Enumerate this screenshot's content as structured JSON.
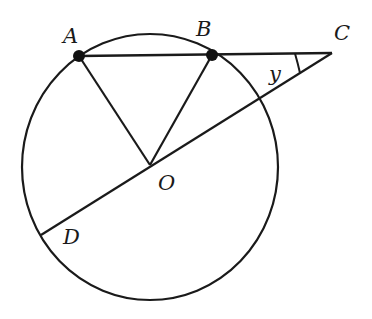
{
  "diagram": {
    "type": "geometry",
    "stroke_color": "#1a1a1a",
    "background": "#ffffff",
    "circle": {
      "center": "O",
      "cx": 150,
      "cy": 167,
      "rx": 128,
      "ry": 133
    },
    "points": {
      "A": {
        "label": "A",
        "x": 79,
        "y": 56,
        "dot": true
      },
      "B": {
        "label": "B",
        "x": 212,
        "y": 55,
        "dot": true
      },
      "C": {
        "label": "C",
        "x": 332,
        "y": 53,
        "dot": false
      },
      "O": {
        "label": "O",
        "x": 150,
        "y": 165,
        "dot": false
      },
      "D": {
        "label": "D",
        "x": 41,
        "y": 235,
        "dot": false
      }
    },
    "segments": [
      {
        "from": "A",
        "to": "C"
      },
      {
        "from": "A",
        "to": "O"
      },
      {
        "from": "B",
        "to": "O"
      },
      {
        "from": "C",
        "to": "D"
      }
    ],
    "angle": {
      "vertex": "C",
      "label": "y"
    }
  }
}
